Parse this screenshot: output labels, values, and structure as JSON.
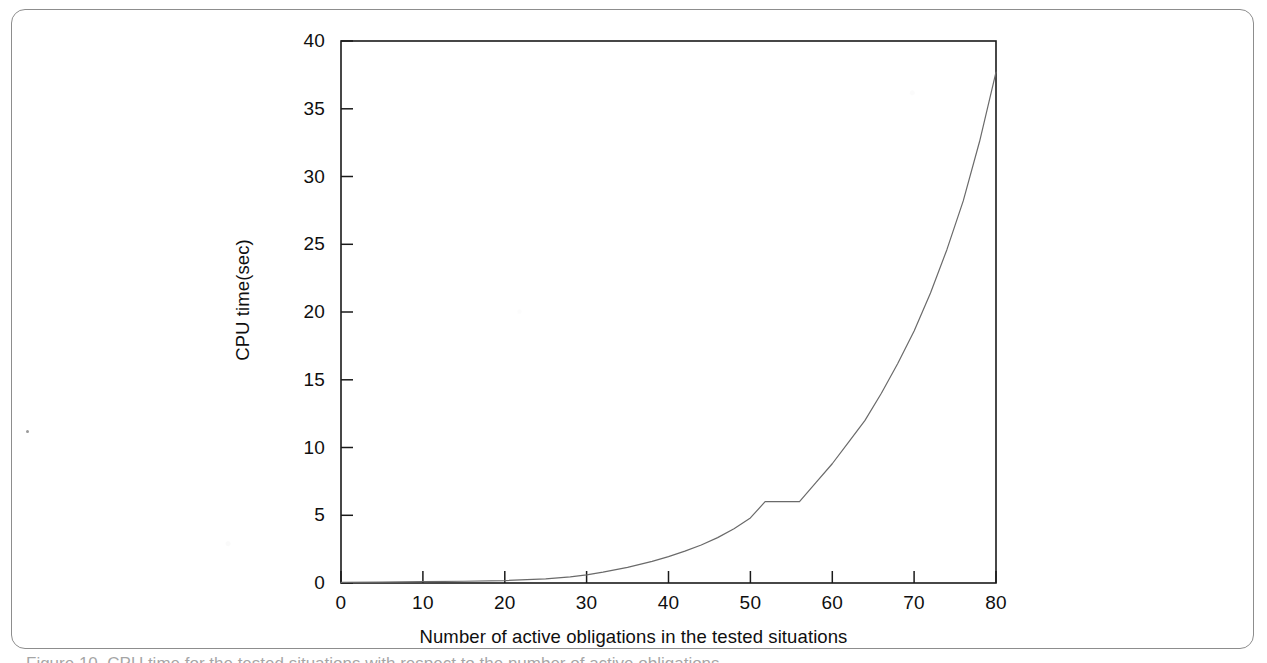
{
  "figure": {
    "background_color": "#ffffff",
    "frame_color": "#8d8d8d",
    "axis_color": "#1a1a1a",
    "curve_color": "#6a6a6a"
  },
  "caption_sliver": "Figure 10. CPU time for the tested situations with respect to the number of active obligations",
  "chart_data": {
    "type": "line",
    "title": "",
    "xlabel": "Number of active obligations in the tested situations",
    "ylabel": "CPU time(sec)",
    "xlim": [
      0,
      80
    ],
    "ylim": [
      0,
      40
    ],
    "xticks": [
      0,
      10,
      20,
      30,
      40,
      50,
      60,
      70,
      80
    ],
    "yticks": [
      0,
      5,
      10,
      15,
      20,
      25,
      30,
      35,
      40
    ],
    "xtick_labels": [
      "0",
      "10",
      "20",
      "30",
      "40",
      "50",
      "60",
      "70",
      "80"
    ],
    "ytick_labels": [
      "0",
      "5",
      "10",
      "15",
      "20",
      "25",
      "30",
      "35",
      "40"
    ],
    "grid": false,
    "legend": null,
    "series": [
      {
        "name": "CPU time",
        "color": "#6a6a6a",
        "line_width": 1.2,
        "x": [
          0,
          5,
          10,
          15,
          20,
          25,
          28,
          30,
          32,
          35,
          38,
          40,
          42,
          44,
          46,
          48,
          50,
          51.8,
          53,
          54.5,
          56,
          58,
          60,
          62,
          64,
          66,
          68,
          70,
          72,
          74,
          76,
          78,
          80
        ],
        "y": [
          0.05,
          0.07,
          0.1,
          0.13,
          0.18,
          0.3,
          0.45,
          0.6,
          0.8,
          1.15,
          1.6,
          1.95,
          2.35,
          2.8,
          3.35,
          4.0,
          4.8,
          6.0,
          6.0,
          6.0,
          6.0,
          7.4,
          8.8,
          10.4,
          12.0,
          14.0,
          16.2,
          18.6,
          21.4,
          24.6,
          28.2,
          32.6,
          37.7
        ]
      }
    ],
    "annotations": [
      {
        "text": "plateau",
        "x_range": [
          51.8,
          56
        ],
        "y": 6.0
      }
    ]
  }
}
